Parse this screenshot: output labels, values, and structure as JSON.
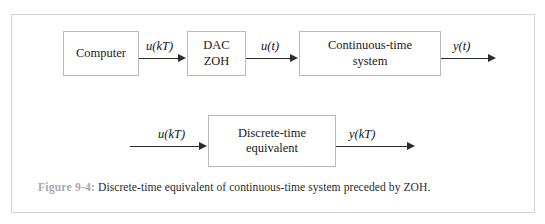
{
  "figure": {
    "top_sliver_text": "· · ·   · ·  · ·   ·  · ·   · · ·  ·  ·  · ·",
    "caption_number": "Figure 9-4:",
    "caption_text": " Discrete-time equivalent of continuous-time system preceded by ZOH.",
    "frame_color": "#d3d3d6",
    "box_border_color": "#b9b9bd",
    "arrow_color": "#2b2b2b",
    "caption_number_color": "#a8a8ac",
    "caption_text_color": "#2c2c2c"
  },
  "row_top": {
    "blocks": [
      {
        "name": "computer",
        "lines": [
          "Computer"
        ]
      },
      {
        "name": "dac-zoh",
        "lines": [
          "DAC",
          "ZOH"
        ]
      },
      {
        "name": "continuous-time-system",
        "lines": [
          "Continuous-time",
          "system"
        ]
      }
    ],
    "signals": [
      {
        "name": "u-kT",
        "text": "u(kT)"
      },
      {
        "name": "u-t",
        "text": "u(t)"
      },
      {
        "name": "y-t",
        "text": "y(t)"
      }
    ]
  },
  "row_bottom": {
    "blocks": [
      {
        "name": "discrete-time-equivalent",
        "lines": [
          "Discrete-time",
          "equivalent"
        ]
      }
    ],
    "signals": [
      {
        "name": "u-kT",
        "text": "u(kT)"
      },
      {
        "name": "y-kT",
        "text": "y(kT)"
      }
    ]
  }
}
